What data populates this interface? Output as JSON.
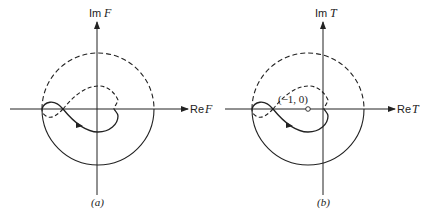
{
  "panels": [
    {
      "id": "a",
      "caption": "(a)",
      "imag_axis": {
        "prefix": "Im",
        "var": "F"
      },
      "real_axis": {
        "prefix": "Re",
        "var": "F"
      }
    },
    {
      "id": "b",
      "caption": "(b)",
      "imag_axis": {
        "prefix": "Im",
        "var": "T"
      },
      "real_axis": {
        "prefix": "Re",
        "var": "T"
      },
      "point_label": "(−1, 0)"
    }
  ],
  "colors": {
    "ink": "#222222",
    "background": "#ffffff"
  }
}
